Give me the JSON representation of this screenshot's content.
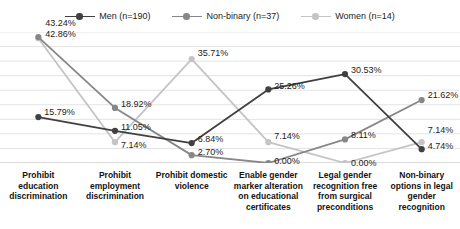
{
  "chart_data": {
    "type": "line",
    "title": "",
    "subtitle": "",
    "xlabel": "",
    "ylabel": "",
    "ylim": [
      0,
      45
    ],
    "grid": true,
    "gridlines": [
      0,
      5,
      10,
      15,
      20,
      25,
      30,
      35,
      40,
      45
    ],
    "y_tick_labels_shown": false,
    "legend_position": "top-center",
    "value_suffix": "%",
    "categories": [
      "Prohibit education discrimination",
      "Prohibit employment discrimination",
      "Prohibit domestic violence",
      "Enable gender marker alteration on educational certificates",
      "Legal gender recognition free from surgical preconditions",
      "Non-binary options in legal gender recognition"
    ],
    "category_lines": [
      [
        "Prohibit",
        "education",
        "discrimination"
      ],
      [
        "Prohibit",
        "employment",
        "discrimination"
      ],
      [
        "Prohibit domestic",
        "violence"
      ],
      [
        "Enable gender",
        "marker alteration",
        "on educational",
        "certificates"
      ],
      [
        "Legal gender",
        "recognition free",
        "from surgical",
        "preconditions"
      ],
      [
        "Non-binary",
        "options in legal",
        "gender",
        "recognition"
      ]
    ],
    "series": [
      {
        "name": "Men (n=190)",
        "label": "Men (n=190)",
        "color": "#404040",
        "values": [
          15.79,
          11.05,
          6.84,
          25.26,
          30.53,
          4.74
        ],
        "labels": [
          "15.79%",
          "11.05%",
          "6.84%",
          "25.26%",
          "30.53%",
          "4.74%"
        ]
      },
      {
        "name": "Non-binary (n=37)",
        "label": "Non-binary (n=37)",
        "color": "#878787",
        "values": [
          43.24,
          18.92,
          2.7,
          0.0,
          8.11,
          21.62
        ],
        "labels": [
          "43.24%",
          "18.92%",
          "2.70%",
          "0.00%",
          "8.11%",
          "21.62%"
        ]
      },
      {
        "name": "Women (n=14)",
        "label": "Women (n=14)",
        "color": "#c4c4c4",
        "values": [
          42.86,
          7.14,
          35.71,
          7.14,
          0.0,
          7.14
        ],
        "labels": [
          "42.86%",
          "7.14%",
          "35.71%",
          "7.14%",
          "0.00%",
          "7.14%"
        ]
      }
    ]
  }
}
